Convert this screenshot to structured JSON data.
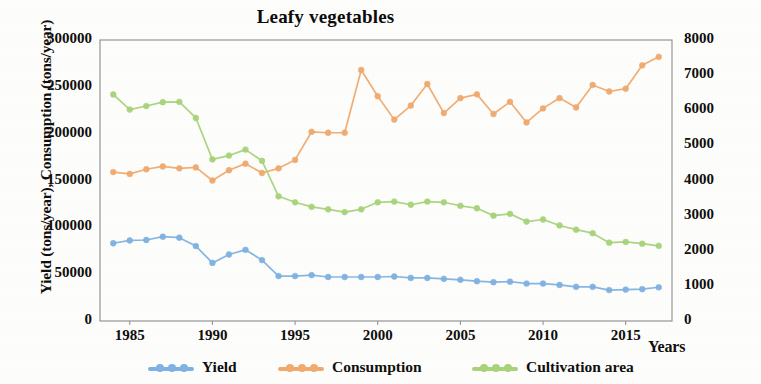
{
  "chart_data": {
    "type": "line",
    "title": "Leafy vegetables",
    "xlabel": "Years",
    "ylabel": "Yield (tons/year), Consumption (tons/year)",
    "y2label": "Cultivation area (ha)",
    "grid": false,
    "legend_position": "bottom",
    "xlim": [
      1983.2,
      2017.8
    ],
    "ylim": [
      0,
      300000
    ],
    "y2lim": [
      0,
      8000
    ],
    "xticks": [
      1985,
      1990,
      1995,
      2000,
      2005,
      2010,
      2015
    ],
    "xtick_labels": [
      "1985",
      "1990",
      "1995",
      "2000",
      "2005",
      "2010",
      "2015"
    ],
    "yticks": [
      0,
      50000,
      100000,
      150000,
      200000,
      250000,
      300000
    ],
    "ytick_labels": [
      "0",
      "50000",
      "100000",
      "150000",
      "200000",
      "250000",
      "300000"
    ],
    "y2ticks": [
      0,
      1000,
      2000,
      3000,
      4000,
      5000,
      6000,
      7000,
      8000
    ],
    "y2tick_labels": [
      "0",
      "1000",
      "2000",
      "3000",
      "4000",
      "5000",
      "6000",
      "7000",
      "8000"
    ],
    "x": [
      1984,
      1985,
      1986,
      1987,
      1988,
      1989,
      1990,
      1991,
      1992,
      1993,
      1994,
      1995,
      1996,
      1997,
      1998,
      1999,
      2000,
      2001,
      2002,
      2003,
      2004,
      2005,
      2006,
      2007,
      2008,
      2009,
      2010,
      2011,
      2012,
      2013,
      2014,
      2015,
      2016,
      2017
    ],
    "series": [
      {
        "name": "Yield",
        "axis": "left",
        "units": "tons/year",
        "color": "#7fb2e0",
        "values": [
          83000,
          86000,
          86500,
          90000,
          89000,
          80000,
          62000,
          71000,
          76000,
          65000,
          48000,
          48000,
          49000,
          47000,
          47000,
          47000,
          47000,
          47500,
          46000,
          46000,
          45000,
          44000,
          42500,
          41500,
          42000,
          40000,
          40000,
          38500,
          36500,
          36500,
          33000,
          33500,
          34000,
          36000
        ]
      },
      {
        "name": "Consumption",
        "axis": "left",
        "units": "tons/year",
        "color": "#f0aa6e",
        "values": [
          159000,
          157000,
          162000,
          165000,
          163000,
          164000,
          150000,
          161000,
          168000,
          158000,
          163000,
          172000,
          202000,
          201000,
          201000,
          268000,
          240000,
          215000,
          230000,
          253000,
          222000,
          238000,
          242000,
          221000,
          234000,
          212000,
          227000,
          238000,
          228000,
          252000,
          245000,
          248000,
          273000,
          282000
        ]
      },
      {
        "name": "Cultivation area",
        "axis": "right",
        "units": "ha",
        "color": "#a8d37a",
        "values": [
          6450,
          6020,
          6120,
          6230,
          6240,
          5780,
          4600,
          4710,
          4880,
          4560,
          3550,
          3380,
          3250,
          3180,
          3100,
          3180,
          3380,
          3400,
          3310,
          3400,
          3380,
          3280,
          3210,
          3000,
          3050,
          2830,
          2890,
          2720,
          2600,
          2500,
          2230,
          2250,
          2200,
          2140
        ]
      }
    ]
  },
  "legend": {
    "items": [
      {
        "label": "Yield",
        "color": "#7fb2e0"
      },
      {
        "label": "Consumption",
        "color": "#f0aa6e"
      },
      {
        "label": "Cultivation area",
        "color": "#a8d37a"
      }
    ]
  },
  "colors": {
    "yield": "#7fb2e0",
    "consumption": "#f0aa6e",
    "cultivation_area": "#a8d37a",
    "axis": "#8c8c8c",
    "text": "#100f0d",
    "background": "#fdfdfc"
  },
  "plot_box": {
    "left": 100,
    "top": 40,
    "right": 672,
    "bottom": 321
  }
}
